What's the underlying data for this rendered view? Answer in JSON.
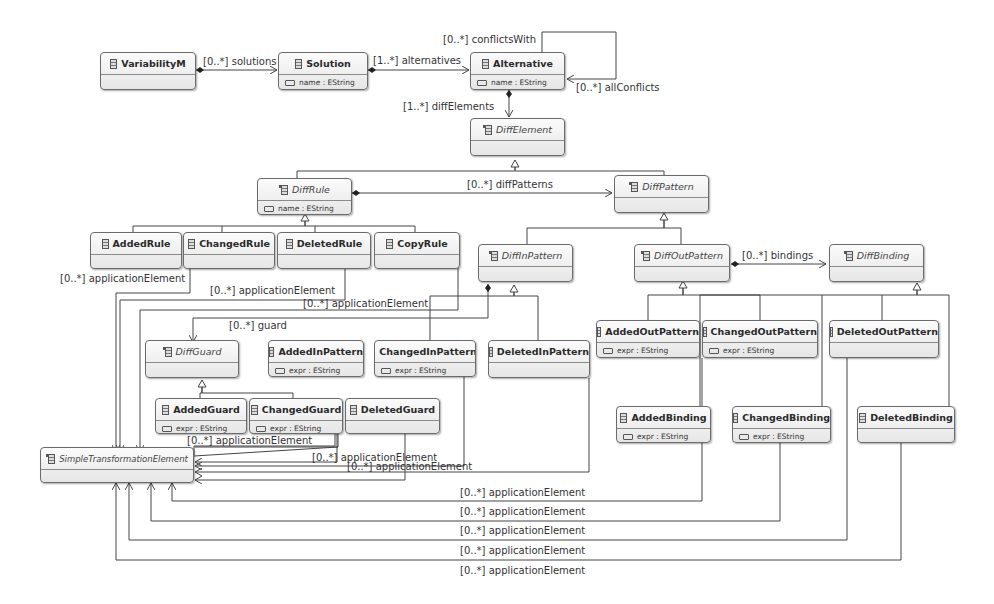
{
  "diagram": {
    "type": "uml-class-diagram",
    "classes": {
      "variabilityM": {
        "name": "VariabilityM",
        "abstract": false,
        "attribute": ""
      },
      "solution": {
        "name": "Solution",
        "abstract": false,
        "attribute": "name : EString"
      },
      "alternative": {
        "name": "Alternative",
        "abstract": false,
        "attribute": "name : EString"
      },
      "diffElement": {
        "name": "DiffElement",
        "abstract": true,
        "attribute": ""
      },
      "diffRule": {
        "name": "DiffRule",
        "abstract": true,
        "attribute": "name : EString"
      },
      "diffPattern": {
        "name": "DiffPattern",
        "abstract": true,
        "attribute": ""
      },
      "addedRule": {
        "name": "AddedRule",
        "abstract": false,
        "attribute": ""
      },
      "changedRule": {
        "name": "ChangedRule",
        "abstract": false,
        "attribute": ""
      },
      "deletedRule": {
        "name": "DeletedRule",
        "abstract": false,
        "attribute": ""
      },
      "copyRule": {
        "name": "CopyRule",
        "abstract": false,
        "attribute": ""
      },
      "diffInPattern": {
        "name": "DiffInPattern",
        "abstract": true,
        "attribute": ""
      },
      "diffOutPattern": {
        "name": "DiffOutPattern",
        "abstract": true,
        "attribute": ""
      },
      "diffBinding": {
        "name": "DiffBinding",
        "abstract": true,
        "attribute": ""
      },
      "diffGuard": {
        "name": "DiffGuard",
        "abstract": true,
        "attribute": ""
      },
      "addedInPattern": {
        "name": "AddedInPattern",
        "abstract": false,
        "attribute": "expr : EString"
      },
      "changedInPattern": {
        "name": "ChangedInPattern",
        "abstract": false,
        "attribute": "expr : EString"
      },
      "deletedInPattern": {
        "name": "DeletedInPattern",
        "abstract": false,
        "attribute": ""
      },
      "addedOutPattern": {
        "name": "AddedOutPattern",
        "abstract": false,
        "attribute": "expr : EString"
      },
      "changedOutPattern": {
        "name": "ChangedOutPattern",
        "abstract": false,
        "attribute": "expr : EString"
      },
      "deletedOutPattern": {
        "name": "DeletedOutPattern",
        "abstract": false,
        "attribute": ""
      },
      "addedGuard": {
        "name": "AddedGuard",
        "abstract": false,
        "attribute": "expr : EString"
      },
      "changedGuard": {
        "name": "ChangedGuard",
        "abstract": false,
        "attribute": "expr : EString"
      },
      "deletedGuard": {
        "name": "DeletedGuard",
        "abstract": false,
        "attribute": ""
      },
      "addedBinding": {
        "name": "AddedBinding",
        "abstract": false,
        "attribute": "expr : EString"
      },
      "changedBinding": {
        "name": "ChangedBinding",
        "abstract": false,
        "attribute": "expr : EString"
      },
      "deletedBinding": {
        "name": "DeletedBinding",
        "abstract": false,
        "attribute": ""
      },
      "simpleTransformationElement": {
        "name": "SimpleTransformationElement",
        "abstract": true,
        "attribute": ""
      }
    },
    "associations": {
      "solutions": "[0..*] solutions",
      "alternatives": "[1..*] alternatives",
      "conflictsWith": "[0..*] conflictsWith",
      "allConflicts": "[0..*] allConflicts",
      "diffElements": "[1..*] diffElements",
      "diffPatterns": "[0..*] diffPatterns",
      "bindings": "[0..*] bindings",
      "guard": "[0..*] guard",
      "applicationElement": "[0..*] applicationElement"
    }
  }
}
